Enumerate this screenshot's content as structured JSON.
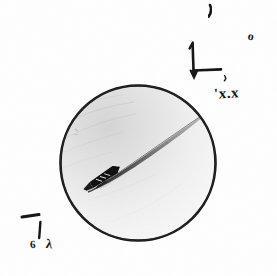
{
  "canvas": {
    "width": 277,
    "height": 276,
    "background_color": "#fefefe",
    "medium": "hand-drawn pencil sketch, scanned"
  },
  "figure": {
    "name": "circular-field-of-view-with-comet-streak",
    "circle": {
      "center_x": 138,
      "center_y": 163,
      "radius": 78,
      "outline_color": "#141414",
      "outline_width": 2.6,
      "fill_light": "#f7f7f7",
      "fill_shadow": "#d9d9d9",
      "shading_note": "upper-left interior shaded darker grey, fading toward lower-right"
    },
    "streak": {
      "description": "tapering comet-like trail crossing the disc from lower-left to upper-right",
      "head_x": 96,
      "head_y": 185,
      "tail_x": 209,
      "tail_y": 111,
      "color": "#2a2a2a"
    },
    "object": {
      "description": "small dark elongated dart/craft shape at the head of the streak with internal hatch marks",
      "x": 104,
      "y": 177,
      "angle_deg": -33,
      "color": "#101010"
    }
  },
  "annotations": {
    "tick_top": {
      "name": "tick-mark",
      "glyph": "comma-tick stroke",
      "x": 209,
      "y": 6
    },
    "letter_o": {
      "name": "letter-o",
      "text": "o",
      "x": 248,
      "y": 30
    },
    "axes": {
      "name": "axis-corner-diagram",
      "description": "vertical stroke with up-arrow joined to a horizontal stroke running right, with a down-arrow at the corner and a small comma tick at lower right",
      "origin_x": 193,
      "origin_y": 70,
      "vertical_top_y": 42,
      "horizontal_right_x": 220,
      "color": "#141414"
    },
    "label_xx": {
      "name": "label-x-x",
      "text": "'x.x",
      "x": 214,
      "y": 86
    },
    "dash_bottom_left": {
      "name": "dash-mark",
      "description": "short horizontal dash above a vertical stroke",
      "x": 22,
      "y": 216,
      "length": 17
    },
    "stroke_bottom_left": {
      "name": "vertical-stroke",
      "x": 40,
      "y": 222,
      "length": 17
    },
    "label_six": {
      "name": "label-six",
      "text": "6",
      "x": 30,
      "y": 239
    },
    "label_lambda": {
      "name": "label-lambda",
      "text": "λ",
      "x": 46,
      "y": 237
    }
  }
}
